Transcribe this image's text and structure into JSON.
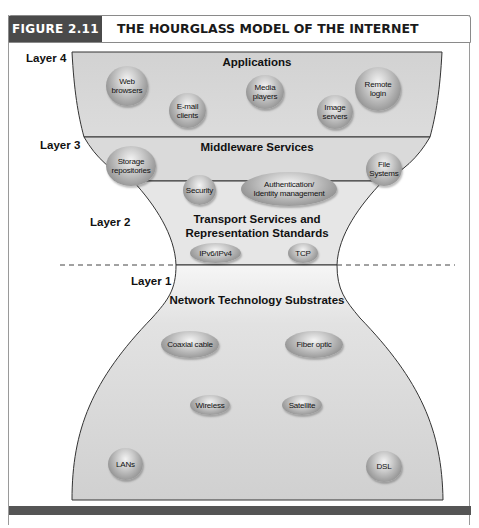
{
  "figure": {
    "tag": "FIGURE 2.11",
    "title": "THE HOURGLASS MODEL OF THE INTERNET"
  },
  "layers": [
    {
      "id": "layer4",
      "label": "Layer 4",
      "title": "Applications",
      "nodes": [
        "Web browsers",
        "E-mail clients",
        "Media players",
        "Image servers",
        "Remote login"
      ]
    },
    {
      "id": "layer3",
      "label": "Layer 3",
      "title": "Middleware Services",
      "nodes": [
        "Storage repositories",
        "Security",
        "Authentication/ Identity management",
        "File Systems"
      ]
    },
    {
      "id": "layer2",
      "label": "Layer 2",
      "title_line1": "Transport Services and",
      "title_line2": "Representation Standards",
      "nodes": [
        "IPv6/IPv4",
        "TCP"
      ]
    },
    {
      "id": "layer1",
      "label": "Layer 1",
      "title": "Network Technology Substrates",
      "nodes": [
        "Coaxial cable",
        "Fiber optic",
        "Wireless",
        "Satellite",
        "LANs",
        "DSL"
      ]
    }
  ],
  "nodes_display": {
    "web_browsers": [
      "Web",
      "browsers"
    ],
    "email_clients": [
      "E-mail",
      "clients"
    ],
    "media_players": [
      "Media",
      "players"
    ],
    "image_servers": [
      "Image",
      "servers"
    ],
    "remote_login": [
      "Remote",
      "login"
    ],
    "storage_repositories": [
      "Storage",
      "repositories"
    ],
    "security": [
      "Security"
    ],
    "auth_identity": [
      "Authentication/",
      "Identity management"
    ],
    "file_systems": [
      "File",
      "Systems"
    ],
    "ipv6_ipv4": [
      "IPv6/IPv4"
    ],
    "tcp": [
      "TCP"
    ],
    "coaxial_cable": [
      "Coaxial cable"
    ],
    "fiber_optic": [
      "Fiber optic"
    ],
    "wireless": [
      "Wireless"
    ],
    "satellite": [
      "Satellite"
    ],
    "lans": [
      "LANs"
    ],
    "dsl": [
      "DSL"
    ]
  },
  "colors": {
    "tag_bg": "#4a4a4a",
    "hourglass_fill": "#d6d6d6",
    "layer2_fill": "#e6e6e6",
    "layer1_top_fill": "#f0f0f0",
    "outline": "#333333",
    "bottom_bar": "#555555"
  }
}
